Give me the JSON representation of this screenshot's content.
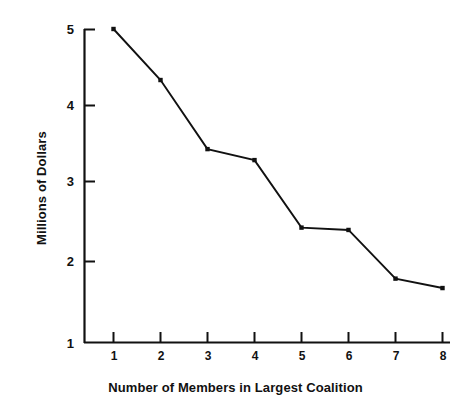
{
  "chart_data": {
    "type": "line",
    "title": "",
    "xlabel": "Number of Members in Largest Coalition",
    "ylabel": "Millions of Dollars",
    "x": [
      1,
      2,
      3,
      4,
      5,
      6,
      7,
      8
    ],
    "values": [
      5.0,
      4.35,
      3.47,
      3.33,
      2.47,
      2.44,
      1.82,
      1.7
    ],
    "xtick_labels": [
      "1",
      "2",
      "3",
      "4",
      "5",
      "6",
      "7",
      "8"
    ],
    "ytick_labels": [
      "1",
      "2",
      "3",
      "4",
      "5"
    ],
    "ytick_values": [
      1,
      2,
      3,
      4,
      5
    ],
    "xlim": [
      0.4,
      8.3
    ],
    "ylim": [
      1,
      5.1
    ],
    "grid": false,
    "legend": false,
    "marker": "square",
    "line_color": "#111111",
    "marker_color": "#111111",
    "background_color": "#ffffff"
  }
}
